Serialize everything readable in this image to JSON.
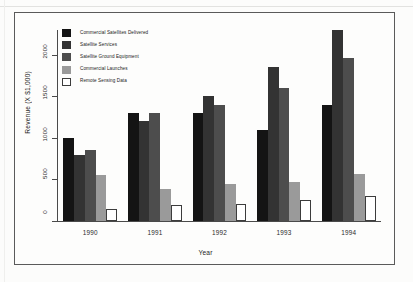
{
  "chart_data": {
    "type": "bar",
    "title": "",
    "xlabel": "Year",
    "ylabel": "Revenue (X $1,000)",
    "categories": [
      "1990",
      "1991",
      "1992",
      "1993",
      "1994"
    ],
    "ylim": [
      0,
      2300
    ],
    "yticks": [
      0,
      500,
      1000,
      1500,
      2000
    ],
    "ytick_labels": [
      "0",
      "500",
      "1000",
      "1500",
      "2000"
    ],
    "grid": false,
    "legend_position": "top-left",
    "series": [
      {
        "name": "Commercial Satellites Delivered",
        "color": "#141414",
        "values": [
          1000,
          1300,
          1300,
          1100,
          1400
        ]
      },
      {
        "name": "Satellite Services",
        "color": "#333333",
        "values": [
          800,
          1200,
          1500,
          1850,
          2300
        ]
      },
      {
        "name": "Satellite Ground Equipment",
        "color": "#4d4d4d",
        "values": [
          860,
          1300,
          1400,
          1600,
          1960
        ]
      },
      {
        "name": "Commercial Launches",
        "color": "#9a9a9a",
        "values": [
          560,
          380,
          450,
          470,
          570
        ]
      },
      {
        "name": "Remote Sensing Data",
        "color": "#ffffff",
        "values": [
          150,
          190,
          210,
          250,
          300
        ]
      }
    ]
  },
  "axis": {
    "y_title": "Revenue (X $1,000)",
    "x_title": "Year"
  }
}
